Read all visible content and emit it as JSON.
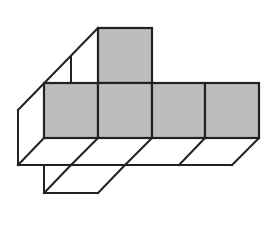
{
  "diagram": {
    "colors": {
      "background": "#ffffff",
      "stroke": "#222222",
      "shaded_fill": "#bdbdbd"
    },
    "shaded_squares": [
      {
        "id": "top",
        "x": 98,
        "y": 28,
        "w": 54,
        "h": 55
      },
      {
        "id": "row-1",
        "x": 44,
        "y": 83,
        "w": 54,
        "h": 55
      },
      {
        "id": "row-2",
        "x": 98,
        "y": 83,
        "w": 54,
        "h": 55
      },
      {
        "id": "row-3",
        "x": 152,
        "y": 83,
        "w": 53,
        "h": 55
      },
      {
        "id": "row-4",
        "x": 205,
        "y": 83,
        "w": 54,
        "h": 55
      }
    ],
    "outline_polylines": [
      {
        "id": "left-slant-top",
        "points": "18,110 98,28"
      },
      {
        "id": "left-back-vertical",
        "points": "71,57 71,83"
      },
      {
        "id": "left-side-vertical",
        "points": "18,110 18,165"
      },
      {
        "id": "bottom-line",
        "points": "18,165 232,165"
      },
      {
        "id": "slant-0",
        "points": "44,138 18,165"
      },
      {
        "id": "slant-1",
        "points": "98,138 71,165"
      },
      {
        "id": "slant-2",
        "points": "152,138 125,165"
      },
      {
        "id": "slant-3",
        "points": "205,138 179,165"
      },
      {
        "id": "slant-4",
        "points": "259,138 232,165"
      },
      {
        "id": "lower-vertical",
        "points": "44,165 44,193"
      },
      {
        "id": "lower-bottom",
        "points": "44,193 98,193"
      },
      {
        "id": "lower-slant-left",
        "points": "71,165 44,193"
      },
      {
        "id": "lower-slant-right",
        "points": "125,165 98,193"
      }
    ]
  }
}
